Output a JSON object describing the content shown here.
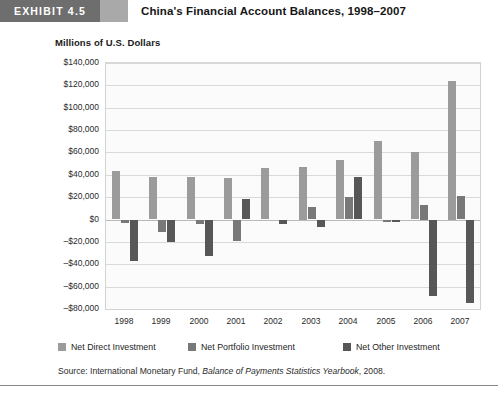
{
  "exhibit": {
    "badge_label": "EXHIBIT 4.5",
    "title": "China's Financial Account Balances, 1998–2007"
  },
  "axis_title": "Millions of U.S. Dollars",
  "legend": [
    {
      "label": "Net Direct Investment",
      "color": "#9b9b9b",
      "icon": "square-swatch-icon"
    },
    {
      "label": "Net Portfolio Investment",
      "color": "#787878",
      "icon": "square-swatch-icon"
    },
    {
      "label": "Net Other Investment",
      "color": "#575757",
      "icon": "square-swatch-icon"
    }
  ],
  "source": {
    "prefix": "Source: International Monetary Fund, ",
    "italic": "Balance of Payments Statistics Yearbook",
    "suffix": ", 2008."
  },
  "chart_data": {
    "type": "bar",
    "title": "China's Financial Account Balances, 1998–2007",
    "subtitle": "",
    "xlabel": "",
    "ylabel": "Millions of U.S. Dollars",
    "ylim": [
      -80000,
      140000
    ],
    "ytick_step": 20000,
    "ytick_labels": [
      "$140,000",
      "$120,000",
      "$100,000",
      "$80,000",
      "$60,000",
      "$40,000",
      "$20,000",
      "$0",
      "–$20,000",
      "–$40,000",
      "–$60,000",
      "–$80,000"
    ],
    "ytick_values": [
      140000,
      120000,
      100000,
      80000,
      60000,
      40000,
      20000,
      0,
      -20000,
      -40000,
      -60000,
      -80000
    ],
    "categories": [
      "1998",
      "1999",
      "2000",
      "2001",
      "2002",
      "2003",
      "2004",
      "2005",
      "2006",
      "2007"
    ],
    "grid": true,
    "legend_position": "bottom",
    "series": [
      {
        "name": "Net Direct Investment",
        "color": "#9b9b9b",
        "values": [
          43000,
          38000,
          38000,
          37000,
          46000,
          47000,
          53000,
          70000,
          60000,
          124000
        ]
      },
      {
        "name": "Net Portfolio Investment",
        "color": "#787878",
        "values": [
          -3000,
          -11000,
          -4000,
          -19000,
          0,
          11000,
          20000,
          -2000,
          13000,
          21000
        ]
      },
      {
        "name": "Net Other Investment",
        "color": "#575757",
        "values": [
          -37000,
          -20000,
          -32000,
          18000,
          -4000,
          -6000,
          38000,
          -2000,
          -68000,
          -74000
        ]
      }
    ]
  }
}
